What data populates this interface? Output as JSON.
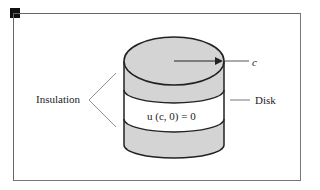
{
  "diagram": {
    "labels": {
      "insulation": "Insulation",
      "disk": "Disk",
      "radius": "c",
      "boundary_condition": "u (c, 0) = 0"
    },
    "colors": {
      "shaded_band": "#d4d4d4",
      "outline": "#222222",
      "frame": "#666666",
      "marker": "#111111"
    }
  }
}
